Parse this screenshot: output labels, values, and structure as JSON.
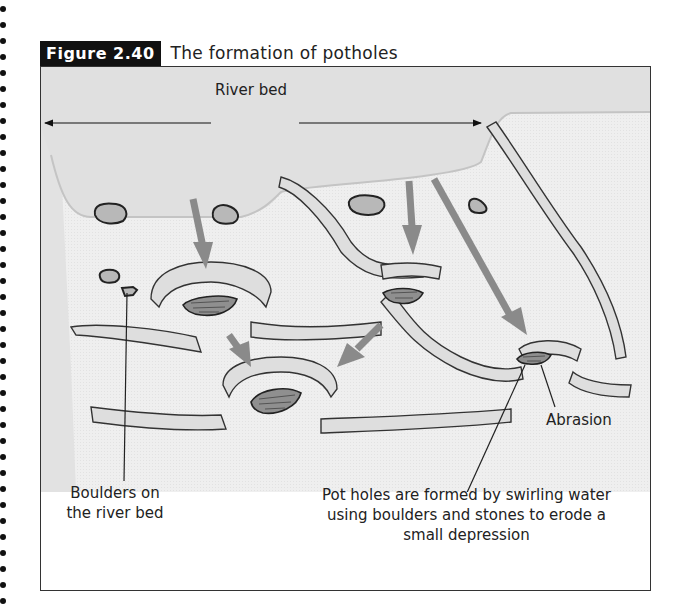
{
  "figure": {
    "number_label": "Figure 2.40",
    "title": "The formation of potholes"
  },
  "labels": {
    "river_bed": "River bed",
    "abrasion": "Abrasion",
    "boulders": [
      "Boulders on",
      "the river bed"
    ],
    "potholes": [
      "Pot holes are formed by swirling water",
      "using boulders and stones to erode a",
      "small depression"
    ]
  },
  "colors": {
    "header_bg": "#111111",
    "frame_border": "#333333",
    "river_surface": "#e3e3e3",
    "bed_fill": "#f0f0f0",
    "arrow_gray": "#8a8a8a",
    "boulder_fill": "#b5b5b5"
  }
}
